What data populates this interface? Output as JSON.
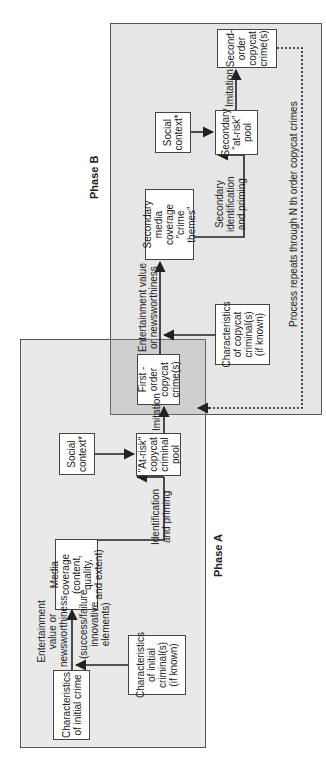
{
  "diagram": {
    "phases": {
      "a": {
        "label": "Phase A"
      },
      "b": {
        "label": "Phase B"
      }
    },
    "nodes": {
      "initial_crime": "Characteristics\nof initial crime",
      "initial_criminal": "Characteristics\nof initial\ncriminal(s)\n(if known)",
      "media_coverage": "Media coverage\n(content, quality,\nand extent)",
      "social_context_a": "Social\ncontext*",
      "at_risk_pool": "\"At-risk\"\ncopycat\ncriminal\npool",
      "first_order": "First -\norder\ncopycat\ncrime(s)",
      "copycat_criminal": "Characteristics\nof copycat\ncriminal(s)\n(if known)",
      "secondary_media": "Secondary\nmedia coverage\n\"crime themes\"",
      "social_context_b": "Social\ncontext*",
      "secondary_pool": "Secondary\n\"at-risk\"\npool",
      "second_order": "Second-\norder\ncopycat\ncrime(s)"
    },
    "edge_labels": {
      "entertainment_a": "Entertainment\nvalue or\nnewsworthiness",
      "success_failure": "(success/failure\ninnovative\nelements)",
      "identification_a": "Identification\nand priming",
      "imitation_a": "Imitation",
      "entertainment_b": "Entertainment value\nor newsworthiness",
      "identification_b": "Secondary\nidentification\nand priming",
      "imitation_b": "Imitation",
      "process_repeats": "Process repeats through N th order copycat crimes"
    },
    "colors": {
      "phase_a_bg": "#e9e9e9",
      "phase_b_bg": "#e6e6e6",
      "overlap_bg": "#cfcfcf",
      "box_bg": "#ffffff",
      "line": "#222222"
    }
  }
}
